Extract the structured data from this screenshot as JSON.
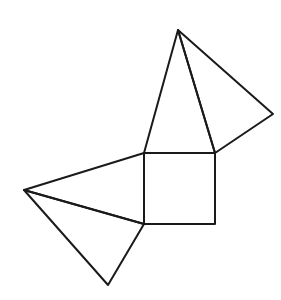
{
  "diagram": {
    "type": "geometric-figure",
    "canvas": {
      "width": 281,
      "height": 300,
      "background": "#ffffff"
    },
    "stroke": {
      "color": "#1a1a1a",
      "width": 2
    },
    "points": {
      "A": [
        178,
        30
      ],
      "B": [
        273,
        114
      ],
      "C": [
        144,
        153
      ],
      "D": [
        215,
        153
      ],
      "E": [
        144,
        224
      ],
      "F": [
        215,
        224
      ],
      "G": [
        24,
        190
      ],
      "H": [
        108,
        285
      ]
    },
    "shapes": [
      {
        "name": "square",
        "vertices": [
          "C",
          "D",
          "F",
          "E"
        ]
      },
      {
        "name": "top-triangle",
        "vertices": [
          "A",
          "C",
          "D"
        ]
      },
      {
        "name": "top-right-triangle",
        "vertices": [
          "A",
          "D",
          "B"
        ]
      },
      {
        "name": "left-triangle",
        "vertices": [
          "G",
          "C",
          "E"
        ]
      },
      {
        "name": "bottom-left-triangle",
        "vertices": [
          "G",
          "E",
          "H"
        ]
      }
    ]
  }
}
